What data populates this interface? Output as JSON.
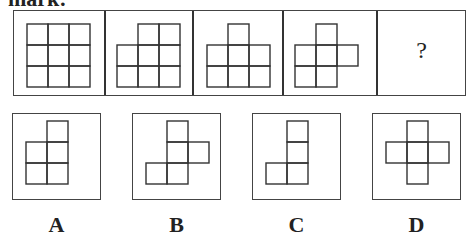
{
  "header": {
    "text": "mark:"
  },
  "sequence": {
    "panels": [
      {
        "id": 1,
        "cells": [
          [
            0,
            0
          ],
          [
            1,
            0
          ],
          [
            2,
            0
          ],
          [
            0,
            1
          ],
          [
            1,
            1
          ],
          [
            2,
            1
          ],
          [
            0,
            2
          ],
          [
            1,
            2
          ],
          [
            2,
            2
          ]
        ]
      },
      {
        "id": 2,
        "cells": [
          [
            1,
            0
          ],
          [
            2,
            0
          ],
          [
            0,
            1
          ],
          [
            1,
            1
          ],
          [
            2,
            1
          ],
          [
            0,
            2
          ],
          [
            1,
            2
          ],
          [
            2,
            2
          ]
        ]
      },
      {
        "id": 3,
        "cells": [
          [
            1,
            0
          ],
          [
            0,
            1
          ],
          [
            1,
            1
          ],
          [
            2,
            1
          ],
          [
            0,
            2
          ],
          [
            1,
            2
          ],
          [
            2,
            2
          ]
        ]
      },
      {
        "id": 4,
        "cells": [
          [
            1,
            0
          ],
          [
            0,
            1
          ],
          [
            1,
            1
          ],
          [
            2,
            1
          ],
          [
            0,
            2
          ],
          [
            1,
            2
          ]
        ]
      },
      {
        "id": 5,
        "question_mark": "?"
      }
    ]
  },
  "options": [
    {
      "label": "A",
      "cells": [
        [
          1,
          0
        ],
        [
          0,
          1
        ],
        [
          1,
          1
        ],
        [
          0,
          2
        ],
        [
          1,
          2
        ]
      ]
    },
    {
      "label": "B",
      "cells": [
        [
          1,
          0
        ],
        [
          1,
          1
        ],
        [
          2,
          1
        ],
        [
          0,
          2
        ],
        [
          1,
          2
        ]
      ]
    },
    {
      "label": "C",
      "cells": [
        [
          1,
          0
        ],
        [
          1,
          1
        ],
        [
          0,
          2
        ],
        [
          1,
          2
        ]
      ]
    },
    {
      "label": "D",
      "cells": [
        [
          1,
          0
        ],
        [
          0,
          1
        ],
        [
          1,
          1
        ],
        [
          2,
          1
        ],
        [
          1,
          2
        ]
      ]
    }
  ]
}
